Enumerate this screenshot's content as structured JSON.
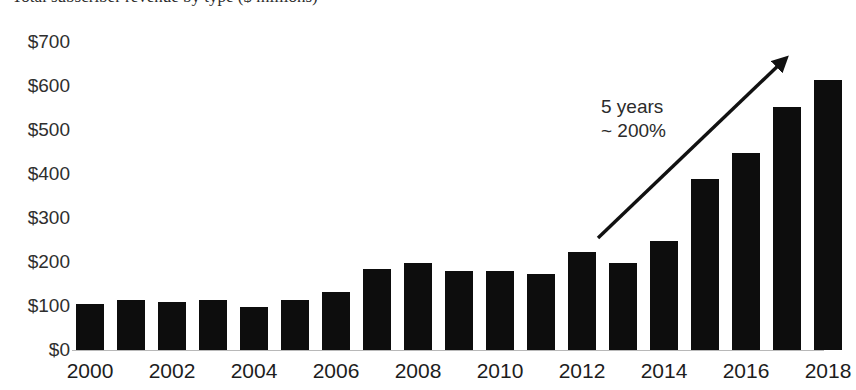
{
  "title": {
    "text": "Total subscriber revenue by type ($ millions)",
    "note": "cropped at top edge of screenshot"
  },
  "chart_data": {
    "type": "bar",
    "title": "",
    "xlabel": "",
    "ylabel": "",
    "ylim": [
      0,
      700
    ],
    "grid": false,
    "legend": "none",
    "categories": [
      "2000",
      "2001",
      "2002",
      "2003",
      "2004",
      "2005",
      "2006",
      "2007",
      "2008",
      "2009",
      "2010",
      "2011",
      "2012",
      "2013",
      "2014",
      "2015",
      "2016",
      "2017",
      "2018"
    ],
    "values": [
      105,
      112,
      108,
      112,
      98,
      113,
      132,
      182,
      196,
      178,
      178,
      172,
      222,
      196,
      247,
      386,
      445,
      549,
      610
    ],
    "y_ticks": [
      "$0",
      "$100",
      "$200",
      "$300",
      "$400",
      "$500",
      "$600",
      "$700"
    ],
    "y_tick_values": [
      0,
      100,
      200,
      300,
      400,
      500,
      600,
      700
    ],
    "x_tick_labels": [
      "2000",
      "2002",
      "2004",
      "2006",
      "2008",
      "2010",
      "2012",
      "2014",
      "2016",
      "2018"
    ],
    "bar_color": "#0d0d0d",
    "background_color": "#ffffff",
    "annotations": [
      {
        "name": "growth-callout",
        "line1": "5 years",
        "line2": "~ 200%",
        "arrow_from_category": "2013",
        "arrow_to_category": "2018"
      }
    ]
  },
  "annotation": {
    "line1": "5 years",
    "line2": "~ 200%"
  },
  "icons": {
    "arrow": "trend-up-arrow-icon"
  }
}
